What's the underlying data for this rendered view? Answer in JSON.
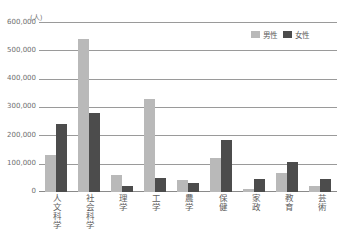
{
  "chart_data": {
    "type": "bar",
    "title": "",
    "unit_label": "(人)",
    "xlabel": "",
    "ylabel": "",
    "ylim": [
      0,
      600000
    ],
    "yticks": [
      "0",
      "100,000",
      "200,000",
      "300,000",
      "400,000",
      "500,000",
      "600,000"
    ],
    "ytick_values": [
      0,
      100000,
      200000,
      300000,
      400000,
      500000,
      600000
    ],
    "grid": true,
    "legend_position": "top-right",
    "categories": [
      "人文科学",
      "社会科学",
      "理学",
      "工学",
      "農学",
      "保健",
      "家政",
      "教育",
      "芸術"
    ],
    "series": [
      {
        "name": "男性",
        "color": "#b9b9b9",
        "values": [
          133000,
          543000,
          60000,
          332000,
          42000,
          120000,
          9000,
          68000,
          22000
        ]
      },
      {
        "name": "女性",
        "color": "#4c4c4c",
        "values": [
          240000,
          281000,
          22000,
          50000,
          32000,
          185000,
          45000,
          105000,
          45000
        ]
      }
    ]
  },
  "legend": {
    "items": [
      {
        "label": "男性",
        "color": "#b9b9b9"
      },
      {
        "label": "女性",
        "color": "#4c4c4c"
      }
    ]
  }
}
